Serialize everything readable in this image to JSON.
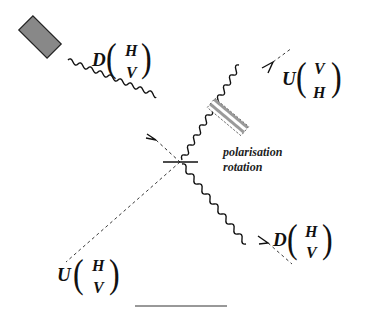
{
  "diagram": {
    "title": "",
    "colors": {
      "ink": "#111111",
      "source_fill": "#888888",
      "rotator_stripe": "#9a9a9a",
      "background": "#ffffff"
    },
    "labels": {
      "input_beam": {
        "operator": "D",
        "top": "H",
        "bottom": "V"
      },
      "output_upper_right": {
        "operator": "U",
        "top": "V",
        "bottom": "H"
      },
      "output_lower_right": {
        "operator": "D",
        "top": "H",
        "bottom": "V"
      },
      "output_lower_left": {
        "operator": "U",
        "top": "H",
        "bottom": "V"
      },
      "rotator_caption_line1": "polarisation",
      "rotator_caption_line2": "rotation"
    },
    "components": [
      {
        "id": "source",
        "label": "source-block"
      },
      {
        "id": "beam-splitter",
        "label": "beam-splitter"
      },
      {
        "id": "polarisation-rotator",
        "label": "polarisation-rotator"
      }
    ]
  }
}
